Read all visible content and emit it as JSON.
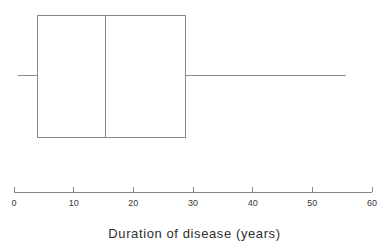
{
  "chart_data": {
    "type": "boxplot",
    "title": "",
    "xlabel": "Duration of disease (years)",
    "ylabel": "",
    "orientation": "horizontal",
    "xlim": [
      0,
      60
    ],
    "grid": false,
    "legend": null,
    "tick_values": [
      0,
      10,
      20,
      30,
      40,
      50,
      60
    ],
    "tick_labels": [
      "0",
      "10",
      "20",
      "30",
      "40",
      "50",
      "60"
    ],
    "boxes": [
      {
        "name": "Duration of disease",
        "whisker_low": 0.7,
        "q1": 4.0,
        "median": 15.4,
        "q3": 28.8,
        "whisker_high": 55.6,
        "outliers": []
      }
    ],
    "style": {
      "line_color": "#8a8a8a",
      "box_fill": "#ffffff",
      "line_width": 1
    }
  },
  "axis": {
    "label": "Duration of disease (years)",
    "ticks": [
      {
        "value": 0,
        "label": "0"
      },
      {
        "value": 10,
        "label": "10"
      },
      {
        "value": 20,
        "label": "20"
      },
      {
        "value": 30,
        "label": "30"
      },
      {
        "value": 40,
        "label": "40"
      },
      {
        "value": 50,
        "label": "50"
      },
      {
        "value": 60,
        "label": "60"
      }
    ]
  },
  "colors": {
    "background": "#ffffff",
    "line": "#8a8a8a",
    "text": "#2e2e2e",
    "tick_text": "#3a3a3a"
  }
}
